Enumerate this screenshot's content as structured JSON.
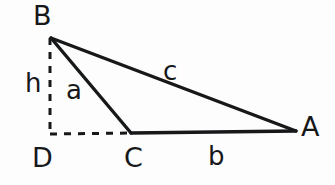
{
  "figure": {
    "type": "geometry-diagram",
    "background_color": "#fdfdfd",
    "stroke_color": "#17181a",
    "vertices": {
      "B": {
        "label": "B",
        "x": 51,
        "y": 38
      },
      "A": {
        "label": "A",
        "x": 296,
        "y": 131
      },
      "C": {
        "label": "C",
        "x": 131,
        "y": 133
      },
      "D": {
        "label": "D",
        "x": 50,
        "y": 134
      }
    },
    "sides": {
      "a": {
        "label": "a",
        "from": "B",
        "to": "C",
        "style": "solid"
      },
      "b": {
        "label": "b",
        "from": "C",
        "to": "A",
        "style": "solid"
      },
      "c": {
        "label": "c",
        "from": "B",
        "to": "A",
        "style": "solid"
      },
      "h": {
        "label": "h",
        "from": "B",
        "to": "D",
        "style": "dashed"
      },
      "base_extension": {
        "label": "",
        "from": "D",
        "to": "C",
        "style": "dashed"
      }
    },
    "labels": {
      "vertex_B": "B",
      "vertex_A": "A",
      "vertex_C": "C",
      "vertex_D": "D",
      "side_h": "h",
      "side_a": "a",
      "side_c": "c",
      "side_b": "b"
    }
  }
}
